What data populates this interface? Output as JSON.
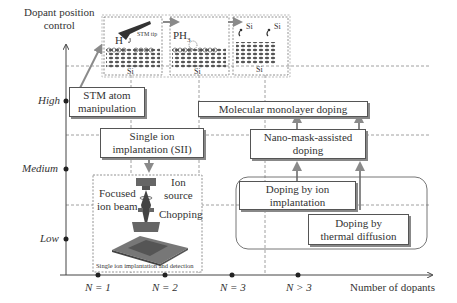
{
  "axes": {
    "y_title_line1": "Dopant position",
    "y_title_line2": "control",
    "y_levels": [
      "High",
      "Medium",
      "Low"
    ],
    "x_title": "Number of dopants",
    "x_ticks": [
      "N = 1",
      "N = 2",
      "N = 3",
      "N > 3"
    ]
  },
  "top_panels": {
    "panel1": {
      "h_label": "H",
      "tip_label": "STM tip",
      "substrate": "Si"
    },
    "panel2": {
      "gas_label": "PH",
      "gas_sub": "3",
      "substrate": "Si"
    },
    "panel3": {
      "atom1": "Si",
      "atom2": "Si",
      "substrate": "Si"
    }
  },
  "boxes": {
    "stm_line1": "STM atom",
    "stm_line2": "manipulation",
    "sii_line1": "Single ion",
    "sii_line2": "implantation (SII)",
    "mono": "Molecular monolayer doping",
    "nano_line1": "Nano-mask-assisted",
    "nano_line2": "doping",
    "ionimp_line1": "Doping by ion",
    "ionimp_line2": "implantation",
    "thermal_line1": "Doping by",
    "thermal_line2": "thermal diffusion"
  },
  "sii_figure": {
    "ion_line1": "Ion",
    "ion_line2": "source",
    "focused_line1": "Focused",
    "focused_line2": "ion beam",
    "chopping": "Chopping",
    "caption": "Single ion implantation and detection"
  },
  "colors": {
    "arrow": "#8a8a8a",
    "axis": "#444444",
    "dashed": "#777777",
    "box_border": "#555555"
  }
}
